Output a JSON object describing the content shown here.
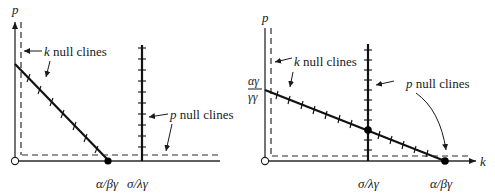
{
  "figure": {
    "panels": [
      {
        "id": "left",
        "origin": [
          15,
          161
        ],
        "y_axis": {
          "label": "p",
          "top": 22,
          "has_arrow": true
        },
        "x_axis": {
          "label": "",
          "right": 220,
          "has_arrow": false
        },
        "k_nullclines": {
          "label_var": "k",
          "label_rest": " null clines",
          "dashed_vertical_x": 22,
          "diagonal": {
            "from": [
              15,
              64
            ],
            "to": [
              108,
              160
            ],
            "ticks": 8
          }
        },
        "p_nullclines": {
          "label_var": "p",
          "label_rest": " null clines",
          "vertical": {
            "x": 142,
            "top": 45,
            "bottom": 161,
            "ticks": 10
          },
          "dashed_horizontal_y": 155
        },
        "equilibria": [
          {
            "x": 108,
            "y": 161,
            "filled": true
          },
          {
            "x": 15,
            "y": 161,
            "filled": false
          }
        ],
        "tick_labels": [
          {
            "text": "α/βγ",
            "x": 96,
            "y": 188
          },
          {
            "text": "σ/λγ",
            "x": 126,
            "y": 188
          }
        ]
      },
      {
        "id": "right",
        "origin": [
          265,
          161
        ],
        "y_axis": {
          "label": "p",
          "top": 28,
          "has_arrow": false
        },
        "x_axis": {
          "label": "k",
          "right": 476,
          "has_arrow": true
        },
        "y_intercept_label": {
          "numerator": "αγ",
          "denominator": "γγ"
        },
        "k_nullclines": {
          "label_var": "k",
          "label_rest": " null clines",
          "dashed_vertical_x": 271,
          "diagonal": {
            "from": [
              265,
              90
            ],
            "to": [
              445,
              161
            ],
            "ticks": 14
          }
        },
        "p_nullclines": {
          "label_var": "p",
          "label_rest": " null clines",
          "vertical": {
            "x": 368,
            "top": 44,
            "bottom": 161,
            "ticks": 12
          },
          "dashed_horizontal_y": 156
        },
        "equilibria": [
          {
            "x": 368,
            "y": 130,
            "filled": true
          },
          {
            "x": 445,
            "y": 161,
            "filled": true
          },
          {
            "x": 265,
            "y": 161,
            "filled": false
          }
        ],
        "tick_labels": [
          {
            "text": "σ/λγ",
            "x": 350,
            "y": 188
          },
          {
            "text": "α/βγ",
            "x": 430,
            "y": 188
          }
        ]
      }
    ]
  }
}
